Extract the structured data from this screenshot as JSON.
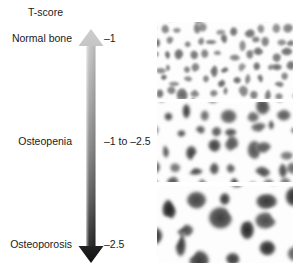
{
  "figure": {
    "title": "T-score",
    "background": "#ffffff"
  },
  "scale": {
    "axis_name": "T-score",
    "direction": "vertical",
    "top_color": "#c9c9c9",
    "bottom_color": "#111111",
    "arrowhead_top": "up",
    "arrowhead_bottom": "down",
    "categories": [
      {
        "label": "Normal bone",
        "value": "–1"
      },
      {
        "label": "Osteopenia",
        "value": "–1 to –2.5"
      },
      {
        "label": "Osteoporosis",
        "value": "–2.5"
      }
    ]
  },
  "panels": [
    {
      "name": "normal-bone",
      "caption": "Normal bone",
      "description": "Dense trabecular bone: small, separate, rounded marrow spaces with thick intervening struts",
      "void_scale": 1.0,
      "void_darkness": 0.62
    },
    {
      "name": "osteopenia-bone",
      "caption": "Osteopenia",
      "description": "Moderately reduced bone mass: enlarged, partly merging marrow spaces and thinning trabeculae",
      "void_scale": 1.45,
      "void_darkness": 0.78
    },
    {
      "name": "osteoporosis-bone",
      "caption": "Osteoporosis",
      "description": "Severely reduced bone mass: large confluent marrow voids separated by thin, sparse trabeculae",
      "void_scale": 2.1,
      "void_darkness": 0.92
    }
  ]
}
